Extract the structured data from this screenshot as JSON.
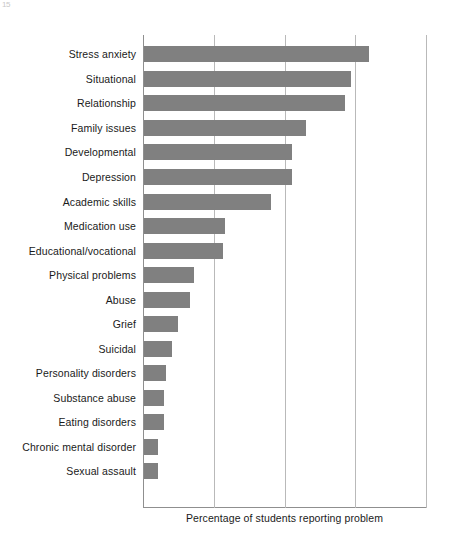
{
  "page": {
    "artifact_text": "15"
  },
  "chart_data": {
    "type": "bar",
    "orientation": "horizontal",
    "title": "",
    "subtitle": "",
    "xlabel": "Percentage of students reporting problem",
    "ylabel": "",
    "categories": [
      "Stress anxiety",
      "Situational",
      "Relationship",
      "Family issues",
      "Developmental",
      "Depression",
      "Academic skills",
      "Medication use",
      "Educational/vocational",
      "Physical problems",
      "Abuse",
      "Grief",
      "Suicidal",
      "Personality disorders",
      "Substance abuse",
      "Eating disorders",
      "Chronic mental disorder",
      "Sexual assault"
    ],
    "values": [
      79.5,
      73.1,
      71.0,
      57.2,
      52.3,
      52.3,
      44.9,
      28.6,
      27.9,
      17.7,
      16.3,
      12.0,
      9.9,
      7.8,
      7.1,
      7.1,
      4.9,
      4.9
    ],
    "xlim": [
      0,
      100
    ],
    "xticks": [
      0,
      25,
      50,
      75,
      100
    ],
    "xtick_labels": [
      "",
      "",
      "",
      "",
      ""
    ],
    "grid": true,
    "grid_axis": "x",
    "legend": false,
    "legend_position": "none",
    "bar_color": "#808080",
    "axis_color": "#8f8f8f",
    "grid_color": "#b9b9b9",
    "text_color": "#1a1a1a"
  }
}
